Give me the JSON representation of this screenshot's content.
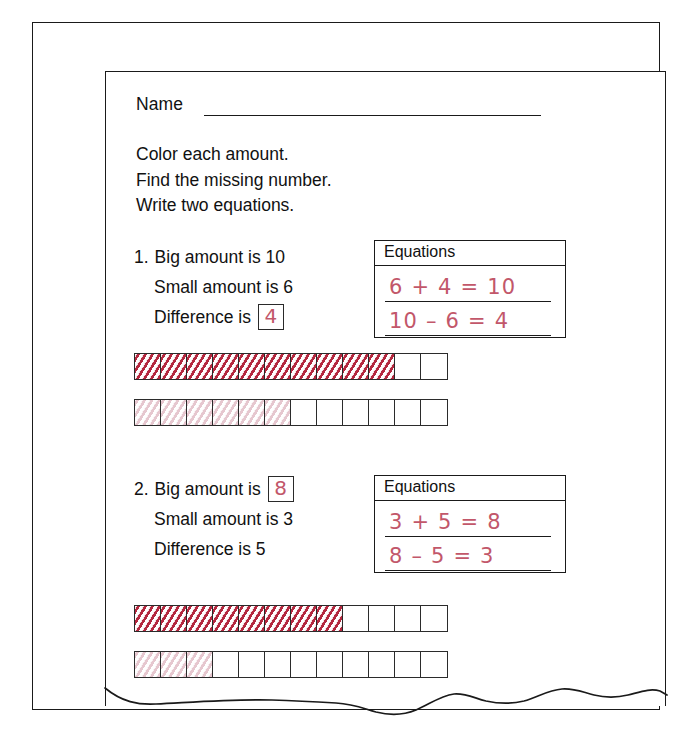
{
  "worksheet": {
    "name_label": "Name",
    "instructions": [
      "Color each amount.",
      "Find the missing number.",
      "Write two equations."
    ],
    "equations_header": "Equations",
    "problems": [
      {
        "number": "1.",
        "big_line": "Big amount is 10",
        "small_line": "Small amount is 6",
        "difference_label": "Difference is",
        "difference_answer": "4",
        "big_answer": null,
        "equations": [
          "6 + 4 = 10",
          "10 – 6 = 4"
        ],
        "strips": [
          {
            "total": 12,
            "filled": 10,
            "shade": "dark"
          },
          {
            "total": 12,
            "filled": 6,
            "shade": "light"
          }
        ]
      },
      {
        "number": "2.",
        "big_label": "Big amount is",
        "big_answer": "8",
        "small_line": "Small amount is 3",
        "difference_line": "Difference is 5",
        "equations": [
          "3 + 5 = 8",
          "8 – 5 = 3"
        ],
        "strips": [
          {
            "total": 12,
            "filled": 8,
            "shade": "dark"
          },
          {
            "total": 12,
            "filled": 3,
            "shade": "light"
          }
        ]
      }
    ]
  },
  "colors": {
    "ink": "#1a1a1a",
    "handwriting_red": "#c2576a",
    "fill_dark": "#b4283f",
    "fill_light": "#e6c7cf"
  }
}
